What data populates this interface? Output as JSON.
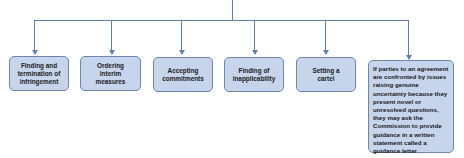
{
  "diagram": {
    "type": "tree",
    "root": "",
    "children": [
      {
        "label": "Finding and termination of infringement"
      },
      {
        "label": "Ordering interim measures"
      },
      {
        "label": "Accepting commitments"
      },
      {
        "label": "Finding of inapplicability"
      },
      {
        "label": "Setting a cartel"
      },
      {
        "label": "If parties to an agreement are confronted by issues raising genuine uncertainty because they present novel or unresolved questions, they may ask the Commission to provide guidance in a written statement called a guidance letter"
      }
    ],
    "colors": {
      "line": "#5f7fb3",
      "box_fill": "#c6d4ec",
      "box_border": "#6f84ab"
    }
  }
}
